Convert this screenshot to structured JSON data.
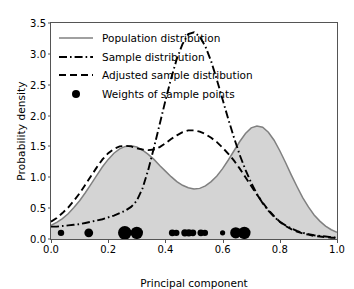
{
  "chart_data": {
    "type": "line",
    "title": "",
    "xlabel": "Principal component",
    "ylabel": "Probability density",
    "xlim": [
      0.0,
      1.0
    ],
    "ylim": [
      0.0,
      3.5
    ],
    "xticks": [
      "0.0",
      "0.2",
      "0.4",
      "0.6",
      "0.8",
      "1.0"
    ],
    "xtick_values": [
      0.0,
      0.2,
      0.4,
      0.6,
      0.8,
      1.0
    ],
    "yticks": [
      "0.0",
      "0.5",
      "1.0",
      "1.5",
      "2.0",
      "2.5",
      "3.0",
      "3.5"
    ],
    "ytick_values": [
      0.0,
      0.5,
      1.0,
      1.5,
      2.0,
      2.5,
      3.0,
      3.5
    ],
    "grid": false,
    "legend_position": "upper left",
    "series": [
      {
        "name": "Population distribution",
        "style": "solid",
        "color": "#808080",
        "filled": true,
        "fill_color": "#d4d4d4",
        "x": [
          0.0,
          0.02,
          0.04,
          0.06,
          0.08,
          0.1,
          0.12,
          0.14,
          0.16,
          0.18,
          0.2,
          0.22,
          0.24,
          0.26,
          0.28,
          0.3,
          0.32,
          0.34,
          0.36,
          0.38,
          0.4,
          0.42,
          0.44,
          0.46,
          0.48,
          0.5,
          0.52,
          0.54,
          0.56,
          0.58,
          0.6,
          0.62,
          0.64,
          0.66,
          0.68,
          0.7,
          0.72,
          0.74,
          0.76,
          0.78,
          0.8,
          0.82,
          0.84,
          0.86,
          0.88,
          0.9,
          0.92,
          0.94,
          0.96,
          0.98,
          1.0
        ],
        "y": [
          0.22,
          0.27,
          0.33,
          0.41,
          0.51,
          0.62,
          0.75,
          0.89,
          1.03,
          1.17,
          1.29,
          1.39,
          1.46,
          1.5,
          1.51,
          1.49,
          1.44,
          1.37,
          1.29,
          1.19,
          1.1,
          1.01,
          0.93,
          0.87,
          0.83,
          0.81,
          0.82,
          0.86,
          0.93,
          1.02,
          1.14,
          1.28,
          1.43,
          1.58,
          1.71,
          1.8,
          1.83,
          1.81,
          1.73,
          1.6,
          1.43,
          1.24,
          1.04,
          0.85,
          0.67,
          0.52,
          0.39,
          0.29,
          0.21,
          0.15,
          0.11
        ]
      },
      {
        "name": "Sample distribution",
        "style": "dashdot",
        "color": "#000000",
        "filled": false,
        "x": [
          0.0,
          0.02,
          0.04,
          0.06,
          0.08,
          0.1,
          0.12,
          0.14,
          0.16,
          0.18,
          0.2,
          0.22,
          0.24,
          0.26,
          0.28,
          0.3,
          0.32,
          0.34,
          0.36,
          0.38,
          0.4,
          0.42,
          0.44,
          0.46,
          0.48,
          0.5,
          0.52,
          0.54,
          0.56,
          0.58,
          0.6,
          0.62,
          0.64,
          0.66,
          0.68,
          0.7,
          0.72,
          0.74,
          0.76,
          0.78,
          0.8,
          0.82,
          0.84,
          0.86,
          0.88,
          0.9,
          0.92,
          0.94,
          0.96,
          0.98,
          1.0
        ],
        "y": [
          0.2,
          0.2,
          0.21,
          0.22,
          0.23,
          0.24,
          0.26,
          0.28,
          0.3,
          0.32,
          0.35,
          0.38,
          0.42,
          0.46,
          0.52,
          0.62,
          0.82,
          1.12,
          1.48,
          1.86,
          2.24,
          2.6,
          2.92,
          3.16,
          3.32,
          3.35,
          3.28,
          3.12,
          2.88,
          2.58,
          2.26,
          1.94,
          1.64,
          1.36,
          1.12,
          0.91,
          0.73,
          0.58,
          0.46,
          0.36,
          0.28,
          0.22,
          0.17,
          0.13,
          0.1,
          0.08,
          0.06,
          0.05,
          0.04,
          0.03,
          0.02
        ]
      },
      {
        "name": "Adjusted sample distribution",
        "style": "dashed",
        "color": "#000000",
        "filled": false,
        "x": [
          0.0,
          0.02,
          0.04,
          0.06,
          0.08,
          0.1,
          0.12,
          0.14,
          0.16,
          0.18,
          0.2,
          0.22,
          0.24,
          0.26,
          0.28,
          0.3,
          0.32,
          0.34,
          0.36,
          0.38,
          0.4,
          0.42,
          0.44,
          0.46,
          0.48,
          0.5,
          0.52,
          0.54,
          0.56,
          0.58,
          0.6,
          0.62,
          0.64,
          0.66,
          0.68,
          0.7,
          0.72,
          0.74,
          0.76,
          0.78,
          0.8,
          0.82,
          0.84,
          0.86,
          0.88,
          0.9,
          0.92,
          0.94,
          0.96,
          0.98,
          1.0
        ],
        "y": [
          0.28,
          0.34,
          0.42,
          0.51,
          0.62,
          0.74,
          0.88,
          1.02,
          1.16,
          1.29,
          1.39,
          1.46,
          1.5,
          1.51,
          1.5,
          1.47,
          1.45,
          1.44,
          1.45,
          1.49,
          1.55,
          1.62,
          1.68,
          1.73,
          1.76,
          1.76,
          1.74,
          1.7,
          1.64,
          1.57,
          1.48,
          1.38,
          1.27,
          1.14,
          1.0,
          0.86,
          0.72,
          0.59,
          0.47,
          0.37,
          0.28,
          0.21,
          0.16,
          0.12,
          0.09,
          0.07,
          0.05,
          0.04,
          0.03,
          0.02,
          0.02
        ]
      }
    ],
    "scatter": {
      "name": "Weights of sample points",
      "color": "#000000",
      "y": 0.1,
      "points": [
        {
          "x": 0.035,
          "size": 3.2
        },
        {
          "x": 0.132,
          "size": 4.4
        },
        {
          "x": 0.258,
          "size": 6.8
        },
        {
          "x": 0.3,
          "size": 6.2
        },
        {
          "x": 0.424,
          "size": 3.4
        },
        {
          "x": 0.438,
          "size": 3.2
        },
        {
          "x": 0.468,
          "size": 3.6
        },
        {
          "x": 0.482,
          "size": 3.6
        },
        {
          "x": 0.496,
          "size": 3.4
        },
        {
          "x": 0.524,
          "size": 3.4
        },
        {
          "x": 0.538,
          "size": 3.2
        },
        {
          "x": 0.6,
          "size": 2.6
        },
        {
          "x": 0.646,
          "size": 5.6
        },
        {
          "x": 0.676,
          "size": 6.2
        }
      ]
    },
    "legend_entries": [
      {
        "label": "Population distribution",
        "style": "solid",
        "color": "#808080"
      },
      {
        "label": "Sample distribution",
        "style": "dashdot",
        "color": "#000000"
      },
      {
        "label": "Adjusted sample distribution",
        "style": "dashed",
        "color": "#000000"
      },
      {
        "label": "Weights of sample points",
        "style": "marker",
        "color": "#000000"
      }
    ]
  }
}
